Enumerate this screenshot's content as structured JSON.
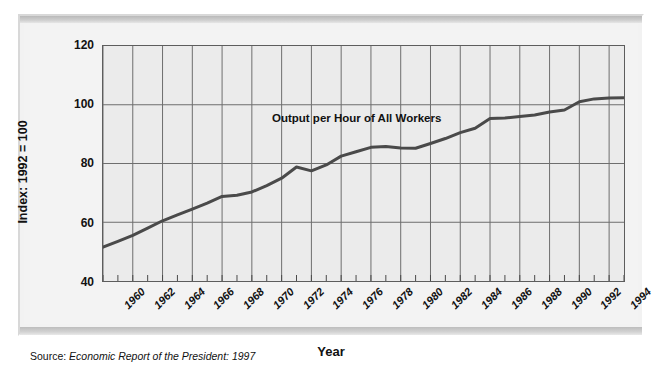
{
  "chart_data": {
    "type": "line",
    "title": "",
    "xlabel": "Year",
    "ylabel": "Index: 1992 = 100",
    "series_label": "Output per Hour of All Workers",
    "xlim": [
      1960,
      1995
    ],
    "ylim": [
      40,
      120
    ],
    "y_ticks": [
      120,
      100,
      80,
      60,
      40
    ],
    "x_ticks": [
      1960,
      1962,
      1964,
      1966,
      1968,
      1970,
      1972,
      1974,
      1976,
      1978,
      1980,
      1982,
      1984,
      1986,
      1988,
      1990,
      1992,
      1994
    ],
    "grid": "both",
    "legend_position": "inline-annotation",
    "line_color": "#4a4a4a",
    "plot_background": "#ebebeb",
    "x": [
      1960,
      1961,
      1962,
      1963,
      1964,
      1965,
      1966,
      1967,
      1968,
      1969,
      1970,
      1971,
      1972,
      1973,
      1974,
      1975,
      1976,
      1977,
      1978,
      1979,
      1980,
      1981,
      1982,
      1983,
      1984,
      1985,
      1986,
      1987,
      1988,
      1989,
      1990,
      1991,
      1992,
      1993,
      1994,
      1995
    ],
    "values": [
      51.5,
      53.5,
      55.5,
      58.0,
      60.5,
      62.5,
      64.5,
      66.5,
      68.8,
      69.2,
      70.3,
      72.5,
      75.0,
      78.8,
      77.5,
      79.5,
      82.5,
      84.0,
      85.5,
      85.8,
      85.3,
      85.2,
      86.8,
      88.5,
      90.5,
      92.0,
      95.3,
      95.5,
      96.0,
      96.5,
      97.5,
      98.2,
      101.0,
      102.0,
      102.3,
      102.4
    ],
    "series": [
      {
        "name": "Output per Hour of All Workers",
        "values": [
          51.5,
          53.5,
          55.5,
          58.0,
          60.5,
          62.5,
          64.5,
          66.5,
          68.8,
          69.2,
          70.3,
          72.5,
          75.0,
          78.8,
          77.5,
          79.5,
          82.5,
          84.0,
          85.5,
          85.8,
          85.3,
          85.2,
          86.8,
          88.5,
          90.5,
          92.0,
          95.3,
          95.5,
          96.0,
          96.5,
          97.5,
          98.2,
          101.0,
          102.0,
          102.3,
          102.4
        ]
      }
    ]
  },
  "source": {
    "lead": "Source: ",
    "body": "Economic Report of the President: 1997"
  }
}
